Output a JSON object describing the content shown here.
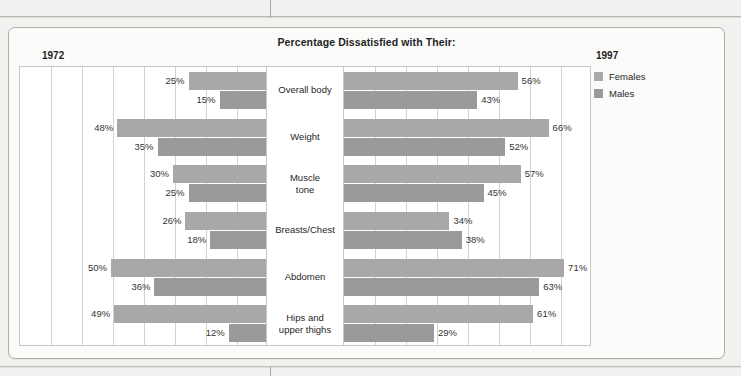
{
  "page": {
    "background_color": "#f2f1ef",
    "frame_color": "#b0aeaa"
  },
  "chart_title": "Percentage Dissatisfied with Their:",
  "year_left": "1972",
  "year_right": "1997",
  "legend": {
    "items": [
      {
        "label": "Females",
        "color": "#a8a8a8",
        "swatch_name": "legend-swatch-females"
      },
      {
        "label": "Males",
        "color": "#9a9a9a",
        "swatch_name": "legend-swatch-males"
      }
    ]
  },
  "chart_data": {
    "type": "bar",
    "title": "Percentage Dissatisfied with Their:",
    "subtitle": "",
    "xlabel": "",
    "ylabel": "",
    "orientation": "horizontal",
    "layout": "back-to-back diverging (1972 left, 1997 right)",
    "grid": true,
    "grid_interval": 10,
    "xlim_left": [
      80,
      0
    ],
    "xlim_right": [
      0,
      80
    ],
    "axis_max": 80,
    "legend_position": "right",
    "categories": [
      "Overall body",
      "Weight",
      "Muscle tone",
      "Breasts/Chest",
      "Abdomen",
      "Hips and upper thighs"
    ],
    "category_lines": [
      [
        "Overall body"
      ],
      [
        "Weight"
      ],
      [
        "Muscle",
        "tone"
      ],
      [
        "Breasts/Chest"
      ],
      [
        "Abdomen"
      ],
      [
        "Hips and",
        "upper thighs"
      ]
    ],
    "panels": [
      {
        "name": "1972",
        "direction": "left",
        "series": [
          {
            "name": "Females",
            "color": "#a8a8a8",
            "values": [
              25,
              48,
              30,
              26,
              50,
              49
            ]
          },
          {
            "name": "Males",
            "color": "#9a9a9a",
            "values": [
              15,
              35,
              25,
              18,
              36,
              12
            ]
          }
        ]
      },
      {
        "name": "1997",
        "direction": "right",
        "series": [
          {
            "name": "Females",
            "color": "#a8a8a8",
            "values": [
              56,
              66,
              57,
              34,
              71,
              61
            ]
          },
          {
            "name": "Males",
            "color": "#9a9a9a",
            "values": [
              43,
              52,
              45,
              38,
              63,
              29
            ]
          }
        ]
      }
    ],
    "value_labels": {
      "1972": {
        "Females": [
          "25%",
          "48%",
          "30%",
          "26%",
          "50%",
          "49%"
        ],
        "Males": [
          "15%",
          "35%",
          "25%",
          "18%",
          "36%",
          "12%"
        ]
      },
      "1997": {
        "Females": [
          "56%",
          "66%",
          "57%",
          "34%",
          "71%",
          "61%"
        ],
        "Males": [
          "43%",
          "52%",
          "45%",
          "38%",
          "63%",
          "29%"
        ]
      }
    }
  }
}
